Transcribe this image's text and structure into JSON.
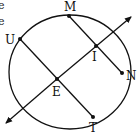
{
  "diagram": {
    "type": "circle-chords-transversal",
    "fragments": [
      "e",
      "e"
    ],
    "points": {
      "M": {
        "label": "M"
      },
      "U": {
        "label": "U"
      },
      "I": {
        "label": "I"
      },
      "N": {
        "label": "N"
      },
      "E": {
        "label": "E"
      },
      "T": {
        "label": "T"
      }
    },
    "segments": [
      "MN",
      "UT"
    ],
    "line": "EI",
    "colors": {
      "stroke": "#111111",
      "background": "#ffffff"
    }
  }
}
